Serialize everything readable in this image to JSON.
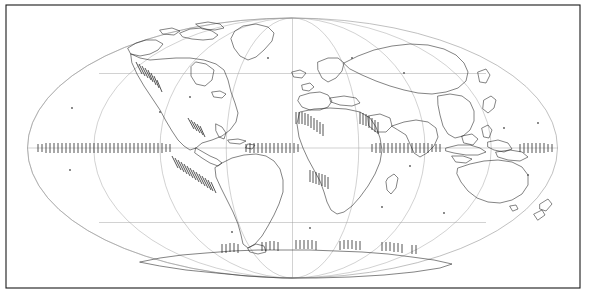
{
  "figure": {
    "type": "world-map",
    "projection": "Mollweide (equal-area elliptical)",
    "title": "",
    "background_color": "#ffffff",
    "frame": {
      "visible": true,
      "color": "#1a1a1a",
      "x": 6,
      "y": 5,
      "width": 574,
      "height": 283
    }
  },
  "map_data": {
    "type": "map",
    "projection": "mollweide",
    "center_longitude": 0,
    "ellipse": {
      "center_x": 292.5,
      "center_y": 148,
      "semi_major_x": 265,
      "semi_minor_y": 130,
      "outline_color": "#8c8c8c"
    },
    "graticule": {
      "visible": true,
      "color": "#9a9a9a",
      "meridian_spacing_deg": 45,
      "meridians_deg": [
        -180,
        -135,
        -90,
        -45,
        0,
        45,
        90,
        135,
        180
      ],
      "parallel_spacing_deg": 45,
      "parallels_deg": [
        -45,
        0,
        45
      ],
      "equator_label": "0",
      "parallel_north_label": "45N",
      "parallel_south_label": "45S"
    },
    "coastlines": {
      "visible": true,
      "color": "#1e1e1e",
      "regions": [
        "North America",
        "Greenland",
        "South America",
        "Europe",
        "Africa",
        "Asia",
        "Indonesia",
        "Australia",
        "New Zealand",
        "Antarctica",
        "Japan",
        "Philippines",
        "Madagascar",
        "Iceland",
        "British Isles"
      ]
    },
    "plate_boundaries": {
      "visible": true,
      "symbol": "hatched-tick-marks",
      "color": "#1a1a1a",
      "description": "Tick / barb marks along convergent and divergent boundaries",
      "segments": [
        {
          "name": "east-pacific-equatorial-ridge",
          "orientation": "horizontal",
          "along": "equator"
        },
        {
          "name": "atlantic-equatorial-ridge",
          "orientation": "horizontal",
          "along": "equator"
        },
        {
          "name": "indian-equatorial-ridge",
          "orientation": "horizontal",
          "along": "equator"
        },
        {
          "name": "west-pacific-equatorial-ridge",
          "orientation": "horizontal",
          "along": "equator"
        },
        {
          "name": "peru-chile-trench",
          "orientation": "diagonal",
          "along": "south-american-west-coast"
        },
        {
          "name": "cascadia-middle-america-trench",
          "orientation": "diagonal",
          "along": "north-american-west-coast"
        },
        {
          "name": "west-african-margin",
          "orientation": "vertical",
          "along": "west-africa"
        },
        {
          "name": "southern-african-margin",
          "orientation": "vertical",
          "along": "southwest-africa"
        },
        {
          "name": "arabian-indian-margin",
          "orientation": "vertical",
          "along": "arabian-sea"
        },
        {
          "name": "antarctic-margin",
          "orientation": "vertical",
          "along": "antarctic-coast"
        }
      ]
    },
    "scattered_points": {
      "visible": true,
      "color": "#555555",
      "description": "Small isolated island markers"
    }
  }
}
